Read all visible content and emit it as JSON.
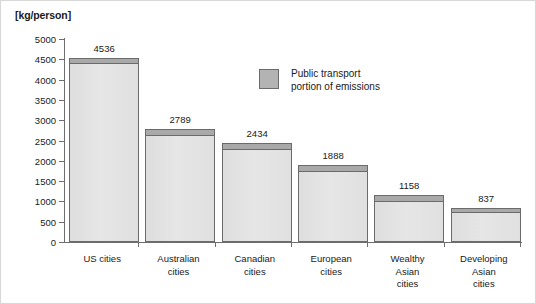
{
  "chart_data": {
    "type": "bar",
    "title": "",
    "subtitle": "",
    "xlabel": "",
    "ylabel": "[kg/person]",
    "ylim": [
      0,
      5000
    ],
    "yticks": [
      0,
      500,
      1000,
      1500,
      2000,
      2500,
      3000,
      3500,
      4000,
      4500,
      5000
    ],
    "ytick_labels": [
      "0",
      "500",
      "1000",
      "1500",
      "2000",
      "2500",
      "3000",
      "3500",
      "4000",
      "4500",
      "5000"
    ],
    "grid": false,
    "legend_position": "inside-upper-center",
    "categories": [
      "US cities",
      "Australian cities",
      "Canadian cities",
      "European cities",
      "Wealthy Asian cities",
      "Developing Asian cities"
    ],
    "category_lines": [
      [
        "US cities"
      ],
      [
        "Australian",
        "cities"
      ],
      [
        "Canadian",
        "cities"
      ],
      [
        "European",
        "cities"
      ],
      [
        "Wealthy",
        "Asian",
        "cities"
      ],
      [
        "Developing",
        "Asian",
        "cities"
      ]
    ],
    "values": [
      4536,
      2789,
      2434,
      1888,
      1158,
      837
    ],
    "data_labels": [
      "4536",
      "2789",
      "2434",
      "1888",
      "1158",
      "837"
    ],
    "series": [
      {
        "name": "Public transport portion of emissions",
        "values": [
          130,
          150,
          150,
          130,
          160,
          95
        ]
      },
      {
        "name": "Other emissions",
        "values": [
          4406,
          2639,
          2284,
          1758,
          998,
          742
        ]
      }
    ],
    "colors": {
      "bar_fill": "#e1e1e1",
      "bar_cap": "#a9a9a9",
      "bar_border": "#6b6b6b",
      "axis": "#6e6e6e",
      "text": "#1a1a1a"
    }
  },
  "legend": {
    "label_lines": [
      "Public transport",
      "portion of emissions"
    ]
  }
}
